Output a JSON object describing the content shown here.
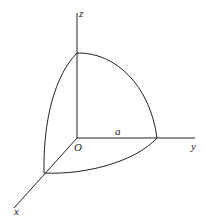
{
  "diagram": {
    "type": "3d-octant-sphere",
    "labels": {
      "z_axis": "z",
      "y_axis": "y",
      "x_axis": "x",
      "origin": "O",
      "radius": "a"
    },
    "colors": {
      "stroke": "#222222",
      "background": "#ffffff"
    }
  }
}
